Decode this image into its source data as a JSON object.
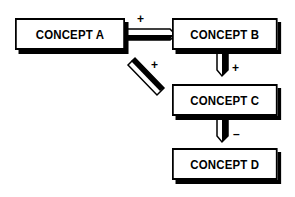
{
  "diagram": {
    "concepts": [
      {
        "id": "A",
        "label": "CONCEPT A"
      },
      {
        "id": "B",
        "label": "CONCEPT B"
      },
      {
        "id": "C",
        "label": "CONCEPT C"
      },
      {
        "id": "D",
        "label": "CONCEPT D"
      }
    ],
    "links": [
      {
        "from": "A",
        "to": "B",
        "sign": "+"
      },
      {
        "from": "A",
        "to": "C",
        "sign": "+"
      },
      {
        "from": "B",
        "to": "C",
        "sign": "+"
      },
      {
        "from": "C",
        "to": "D",
        "sign": "–"
      }
    ]
  }
}
